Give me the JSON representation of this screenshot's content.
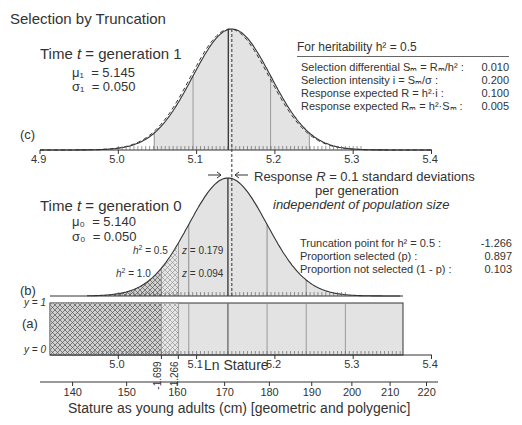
{
  "title": "Selection by Truncation",
  "panels": {
    "c": {
      "label": "(c)",
      "time_label": "Time t = generation 1",
      "time_prefix": "Time ",
      "time_var": "t",
      "time_suffix": " = generation 1",
      "mu_label": "μ₁",
      "mu_value": "= 5.145",
      "sigma_label": "σ₁",
      "sigma_value": "= 0.050",
      "axis_ticks": [
        "4.9",
        "5.0",
        "5.1",
        "5.2",
        "5.3",
        "5.4"
      ]
    },
    "b": {
      "label": "(b)",
      "time_prefix": "Time ",
      "time_var": "t",
      "time_suffix": " = generation 0",
      "mu_label": "μ₀",
      "mu_value": "= 5.140",
      "sigma_label": "σ₀",
      "sigma_value": "= 0.050",
      "h2_05_label": "= 0.5",
      "h2_10_label": "= 1.0",
      "z_179": "= 0.179",
      "z_094": "= 0.094"
    },
    "a": {
      "label": "(a)",
      "y1": "y = 1",
      "y0": "y = 0",
      "axis_ticks": [
        "5.0",
        "5.1",
        "5.2",
        "5.3",
        "5.4"
      ],
      "truncation_ticks": [
        "-1.699",
        "-1.266"
      ],
      "xlabel": "Ln Stature"
    }
  },
  "response": {
    "line1_prefix": "Response ",
    "line1_var": "R",
    "line1_suffix": " = 0.1 standard deviations",
    "line2": "per generation",
    "line3": "independent of population size"
  },
  "heritability_table": {
    "header": "For heritability h² = 0.5",
    "rows": [
      {
        "label": "Selection differential Sₘ = Rₘ/h² :",
        "value": "0.010"
      },
      {
        "label": "Selection intensity i = Sₘ/σ :",
        "value": "0.200"
      },
      {
        "label": "Response expected R = h²·i :",
        "value": "0.100"
      },
      {
        "label": "Response expected Rₘ = h²·Sₘ :",
        "value": "0.005"
      }
    ]
  },
  "truncation_table": {
    "rows": [
      {
        "label": "Truncation point for h² = 0.5 :",
        "value": "-1.266"
      },
      {
        "label": "Proportion selected (p) :",
        "value": "0.897"
      },
      {
        "label": "Proportion not selected (1 - p) :",
        "value": "0.103"
      }
    ]
  },
  "stature_axis": {
    "ticks": [
      "140",
      "150",
      "160",
      "170",
      "180",
      "190",
      "200",
      "210",
      "220"
    ],
    "xlabel": "Stature as young adults (cm) [geometric and polygenic]"
  },
  "chart_data": [
    {
      "type": "area",
      "title": "Selection by Truncation — generation 1 (c)",
      "xlabel": "Ln Stature",
      "xlim": [
        4.9,
        5.4
      ],
      "x_ticks": [
        4.9,
        5.0,
        5.1,
        5.2,
        5.3,
        5.4
      ],
      "series": [
        {
          "name": "generation 1 normal",
          "mean": 5.145,
          "sd": 0.05,
          "style": "solid"
        },
        {
          "name": "generation 0 reference",
          "mean": 5.14,
          "sd": 0.05,
          "style": "dashed"
        }
      ]
    },
    {
      "type": "area",
      "title": "generation 0 (b)",
      "xlabel": "Ln Stature",
      "xlim": [
        4.9,
        5.4
      ],
      "series": [
        {
          "name": "generation 0 normal",
          "mean": 5.14,
          "sd": 0.05
        }
      ],
      "annotations": [
        {
          "text": "h² = 0.5",
          "truncation_z": -1.266,
          "density_z": 0.179
        },
        {
          "text": "h² = 1.0",
          "truncation_z": -1.699,
          "density_z": 0.094
        },
        {
          "text": "Response R = 0.1 standard deviations per generation independent of population size"
        }
      ]
    },
    {
      "type": "bar",
      "title": "Truncation selection indicator (a)",
      "ylabel_ticks": [
        "y = 0",
        "y = 1"
      ],
      "truncation_points": [
        -1.699,
        -1.266
      ],
      "x_ticks": [
        5.0,
        5.1,
        5.2,
        5.3,
        5.4
      ],
      "secondary_axis": {
        "label": "Stature as young adults (cm) [geometric and polygenic]",
        "ticks": [
          140,
          150,
          160,
          170,
          180,
          190,
          200,
          210,
          220
        ]
      }
    }
  ]
}
